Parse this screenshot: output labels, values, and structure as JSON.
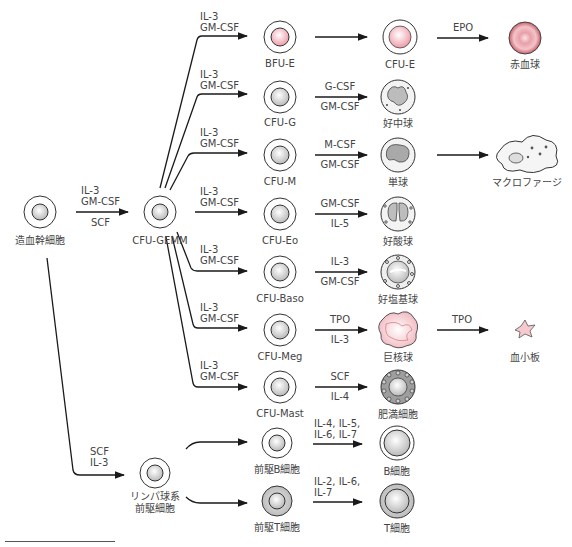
{
  "diagram": {
    "title": "",
    "nodes": {
      "hsc": {
        "label": "造血幹細胞"
      },
      "cfu_gemm": {
        "label": "CFU-GEMM"
      },
      "bfu_e": {
        "label": "BFU-E"
      },
      "cfu_e": {
        "label": "CFU-E"
      },
      "rbc": {
        "label": "赤血球"
      },
      "cfu_g": {
        "label": "CFU-G"
      },
      "neutrophil": {
        "label": "好中球"
      },
      "cfu_m": {
        "label": "CFU-M"
      },
      "monocyte": {
        "label": "単球"
      },
      "macrophage": {
        "label": "マクロファージ"
      },
      "cfu_eo": {
        "label": "CFU-Eo"
      },
      "eosinophil": {
        "label": "好酸球"
      },
      "cfu_baso": {
        "label": "CFU-Baso"
      },
      "basophil": {
        "label": "好塩基球"
      },
      "cfu_meg": {
        "label": "CFU-Meg"
      },
      "megakaryocyte": {
        "label": "巨核球"
      },
      "platelet": {
        "label": "血小板"
      },
      "cfu_mast": {
        "label": "CFU-Mast"
      },
      "mast_cell": {
        "label": "肥満細胞"
      },
      "lymphoid_progenitor": {
        "label1": "リンパ球系",
        "label2": "前駆細胞"
      },
      "pre_b": {
        "label": "前駆B細胞"
      },
      "b_cell": {
        "label": "B細胞"
      },
      "pre_t": {
        "label": "前駆T細胞"
      },
      "t_cell": {
        "label": "T細胞"
      }
    },
    "edges": {
      "hsc_to_gemm": {
        "above1": "IL-3",
        "above2": "GM-CSF",
        "below": "SCF"
      },
      "gemm_to_bfu_e": {
        "l1": "IL-3",
        "l2": "GM-CSF"
      },
      "gemm_to_cfu_g": {
        "l1": "IL-3",
        "l2": "GM-CSF"
      },
      "gemm_to_cfu_m": {
        "l1": "IL-3",
        "l2": "GM-CSF"
      },
      "gemm_to_cfu_eo": {
        "l1": "IL-3",
        "l2": "GM-CSF"
      },
      "gemm_to_cfu_baso": {
        "l1": "IL-3",
        "l2": "GM-CSF"
      },
      "gemm_to_cfu_meg": {
        "l1": "IL-3",
        "l2": "GM-CSF"
      },
      "gemm_to_cfu_mast": {
        "l1": "IL-3",
        "l2": "GM-CSF"
      },
      "cfu_e_to_rbc": {
        "above": "EPO"
      },
      "cfu_g_to_neutrophil": {
        "above": "G-CSF",
        "below": "GM-CSF"
      },
      "cfu_m_to_monocyte": {
        "above": "M-CSF",
        "below": "GM-CSF"
      },
      "cfu_eo_to_eosinophil": {
        "above": "GM-CSF",
        "below": "IL-5"
      },
      "cfu_baso_to_basophil": {
        "above": "IL-3",
        "below": "GM-CSF"
      },
      "cfu_meg_to_megakaryocyte": {
        "above": "TPO",
        "below": "IL-3"
      },
      "megakaryocyte_to_platelet": {
        "above": "TPO"
      },
      "cfu_mast_to_mast_cell": {
        "above": "SCF",
        "below": "IL-4"
      },
      "hsc_to_lymphoid": {
        "l1": "SCF",
        "l2": "IL-3"
      },
      "pre_b_to_b": {
        "l1": "IL-4, IL-5,",
        "l2": "IL-6, IL-7"
      },
      "pre_t_to_t": {
        "l1": "IL-2, IL-6,",
        "l2": "IL-7"
      }
    },
    "colors": {
      "line": "#1a1a1a",
      "cell_outline": "#333333",
      "nucleus_gray": "#cfcfcf",
      "erythroid_pink": "#f2b8bf",
      "rbc_red": "#d9707a",
      "megakaryocyte_pink": "#f7d3d8"
    }
  }
}
